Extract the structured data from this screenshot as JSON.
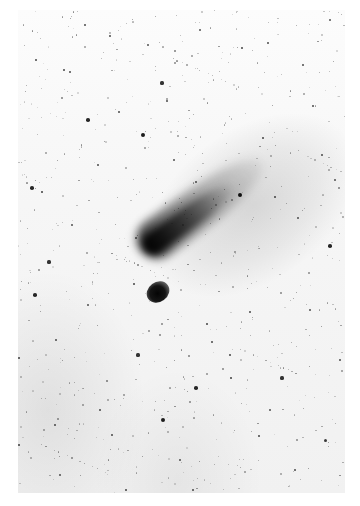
{
  "image": {
    "description": "Negative (inverted) astrophotograph of a comet with a long diagonal tail against a dense star field",
    "subject": "comet",
    "frame": {
      "x": 18,
      "y": 10,
      "width": 327,
      "height": 483
    },
    "colors": {
      "background": "#ffffff",
      "sky": "#f4f4f4",
      "comet_head": "#050505",
      "stars": "#111111"
    },
    "comet": {
      "head": {
        "x": 158,
        "y": 285
      },
      "tail_end": {
        "x": 245,
        "y": 200
      },
      "tail_direction_deg": -36
    },
    "stars": [
      {
        "x": 240,
        "y": 195,
        "r": 2.4
      },
      {
        "x": 143,
        "y": 135,
        "r": 2.0
      },
      {
        "x": 88,
        "y": 120,
        "r": 1.8
      },
      {
        "x": 162,
        "y": 83,
        "r": 1.6
      },
      {
        "x": 32,
        "y": 188,
        "r": 1.8
      },
      {
        "x": 42,
        "y": 192,
        "r": 1.4
      },
      {
        "x": 35,
        "y": 295,
        "r": 1.8
      },
      {
        "x": 49,
        "y": 262,
        "r": 1.6
      },
      {
        "x": 330,
        "y": 246,
        "r": 1.8
      },
      {
        "x": 196,
        "y": 388,
        "r": 1.8
      },
      {
        "x": 163,
        "y": 420,
        "r": 2.0
      },
      {
        "x": 282,
        "y": 378,
        "r": 1.6
      },
      {
        "x": 231,
        "y": 378,
        "r": 1.4
      },
      {
        "x": 138,
        "y": 355,
        "r": 1.6
      },
      {
        "x": 325,
        "y": 440,
        "r": 1.5
      },
      {
        "x": 19,
        "y": 445,
        "r": 1.4
      },
      {
        "x": 19,
        "y": 358,
        "r": 1.4
      },
      {
        "x": 275,
        "y": 197,
        "r": 1.3
      },
      {
        "x": 134,
        "y": 284,
        "r": 1.3
      },
      {
        "x": 230,
        "y": 355,
        "r": 1.3
      },
      {
        "x": 207,
        "y": 324,
        "r": 1.3
      },
      {
        "x": 36,
        "y": 60,
        "r": 1.3
      },
      {
        "x": 64,
        "y": 70,
        "r": 1.3
      },
      {
        "x": 70,
        "y": 72,
        "r": 1.2
      },
      {
        "x": 85,
        "y": 25,
        "r": 1.2
      },
      {
        "x": 110,
        "y": 36,
        "r": 1.2
      },
      {
        "x": 242,
        "y": 48,
        "r": 1.3
      },
      {
        "x": 268,
        "y": 43,
        "r": 1.2
      },
      {
        "x": 303,
        "y": 65,
        "r": 1.2
      },
      {
        "x": 313,
        "y": 106,
        "r": 1.2
      },
      {
        "x": 263,
        "y": 138,
        "r": 1.3
      },
      {
        "x": 322,
        "y": 155,
        "r": 1.2
      },
      {
        "x": 55,
        "y": 425,
        "r": 1.2
      },
      {
        "x": 100,
        "y": 410,
        "r": 1.2
      },
      {
        "x": 112,
        "y": 435,
        "r": 1.2
      },
      {
        "x": 259,
        "y": 436,
        "r": 1.3
      },
      {
        "x": 340,
        "y": 360,
        "r": 1.2
      },
      {
        "x": 295,
        "y": 470,
        "r": 1.2
      },
      {
        "x": 126,
        "y": 490,
        "r": 1.3
      },
      {
        "x": 193,
        "y": 490,
        "r": 1.2
      },
      {
        "x": 250,
        "y": 312,
        "r": 1.2
      },
      {
        "x": 212,
        "y": 342,
        "r": 1.2
      },
      {
        "x": 56,
        "y": 340,
        "r": 1.2
      },
      {
        "x": 98,
        "y": 165,
        "r": 1.2
      },
      {
        "x": 196,
        "y": 182,
        "r": 1.2
      },
      {
        "x": 167,
        "y": 101,
        "r": 1.2
      },
      {
        "x": 119,
        "y": 112,
        "r": 1.2
      },
      {
        "x": 174,
        "y": 160,
        "r": 1.1
      },
      {
        "x": 136,
        "y": 238,
        "r": 1.1
      },
      {
        "x": 298,
        "y": 218,
        "r": 1.1
      },
      {
        "x": 335,
        "y": 180,
        "r": 1.1
      },
      {
        "x": 72,
        "y": 225,
        "r": 1.1
      },
      {
        "x": 88,
        "y": 305,
        "r": 1.1
      },
      {
        "x": 270,
        "y": 410,
        "r": 1.1
      },
      {
        "x": 310,
        "y": 310,
        "r": 1.1
      },
      {
        "x": 180,
        "y": 460,
        "r": 1.1
      },
      {
        "x": 60,
        "y": 475,
        "r": 1.1
      },
      {
        "x": 148,
        "y": 45,
        "r": 1.1
      },
      {
        "x": 200,
        "y": 30,
        "r": 1.1
      },
      {
        "x": 330,
        "y": 20,
        "r": 1.1
      }
    ]
  }
}
